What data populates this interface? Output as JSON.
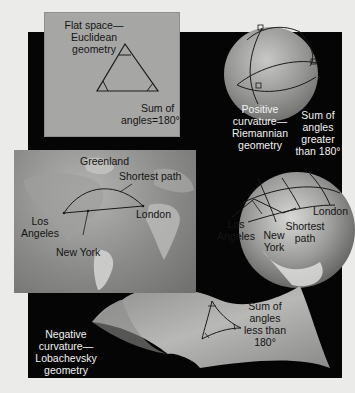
{
  "diagram": {
    "flat": {
      "title_lines": [
        "Flat space—",
        "Euclidean",
        "geometry"
      ],
      "sum_lines": [
        "Sum of",
        "angles=180°"
      ]
    },
    "positive": {
      "title_lines": [
        "Positive",
        "curvature—",
        "Riemannian",
        "geometry"
      ],
      "sum_lines": [
        "Sum of",
        "angles",
        "greater",
        "than 180°"
      ]
    },
    "map": {
      "labels": {
        "greenland": "Greenland",
        "shortest_path": "Shortest path",
        "london": "London",
        "los_angeles_lines": [
          "Los",
          "Angeles"
        ],
        "new_york": "New York"
      }
    },
    "globe": {
      "labels": {
        "london": "London",
        "los_angeles_lines": [
          "Los",
          "Angeles"
        ],
        "shortest_path_lines": [
          "Shortest",
          "path"
        ],
        "new_york_lines": [
          "New",
          "York"
        ]
      }
    },
    "negative": {
      "title_lines": [
        "Negative",
        "curvature—",
        "Lobachevsky",
        "geometry"
      ],
      "sum_lines": [
        "Sum of",
        "angles",
        "less than",
        "180°"
      ]
    },
    "colors": {
      "page_bg": "#ebebe9",
      "panel_bg": "#050505",
      "flat_box": "#a6a6a4",
      "sphere": "#9a9a98",
      "saddle": "#a0a09e"
    }
  }
}
